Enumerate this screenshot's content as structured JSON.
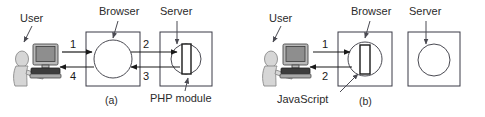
{
  "figure": {
    "title_alt": "Comparison of server-side PHP processing and client-side JavaScript processing",
    "panels": [
      {
        "id": "a",
        "caption": "(a)",
        "user_label": "User",
        "browser_label": "Browser",
        "server_label": "Server",
        "module_label": "PHP module",
        "module_location": "server",
        "arrows": [
          {
            "number": "1",
            "from": "user",
            "to": "browser",
            "direction": "right"
          },
          {
            "number": "2",
            "from": "browser",
            "to": "server",
            "direction": "right"
          },
          {
            "number": "3",
            "from": "server",
            "to": "browser",
            "direction": "left"
          },
          {
            "number": "4",
            "from": "browser",
            "to": "user",
            "direction": "left"
          }
        ]
      },
      {
        "id": "b",
        "caption": "(b)",
        "user_label": "User",
        "browser_label": "Browser",
        "server_label": "Server",
        "module_label": "JavaScript",
        "module_location": "browser",
        "arrows": [
          {
            "number": "1",
            "from": "user",
            "to": "browser",
            "direction": "right"
          },
          {
            "number": "2",
            "from": "browser",
            "to": "user",
            "direction": "left"
          }
        ]
      }
    ]
  },
  "colors": {
    "background": "#ffffff",
    "line": "#1a1a1a",
    "box_stroke": "#3a3a46",
    "circle_stroke": "#4a4a52",
    "text": "#2b2b2b",
    "person": "#d6d6d6",
    "monitor": "#b9b9b9",
    "screen": "#8e8e8e",
    "keyboard": "#3c3c3c"
  }
}
